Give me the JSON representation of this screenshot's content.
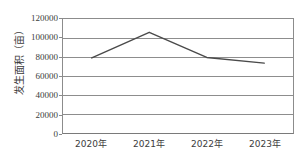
{
  "chart_data": {
    "type": "line",
    "title": "",
    "xlabel": "",
    "ylabel": "发生面积（亩）",
    "categories": [
      "2020年",
      "2021年",
      "2022年",
      "2023年"
    ],
    "series": [
      {
        "name": "发生面积",
        "values": [
          79000,
          106000,
          79500,
          73500
        ]
      }
    ],
    "ylim": [
      0,
      120000
    ],
    "yticks": [
      0,
      20000,
      40000,
      60000,
      80000,
      100000,
      120000
    ],
    "ytick_labels": [
      "0",
      "20000",
      "40000",
      "60000",
      "80000",
      "100000",
      "120000"
    ],
    "grid": true,
    "grid_axis": "y",
    "legend": false,
    "legend_position": "none",
    "line_color": "#4a4a4a",
    "grid_color": "#8c8c8c",
    "axis_color": "#8c8c8c",
    "background_color": "#ffffff",
    "text_color": "#3c3c3c"
  }
}
